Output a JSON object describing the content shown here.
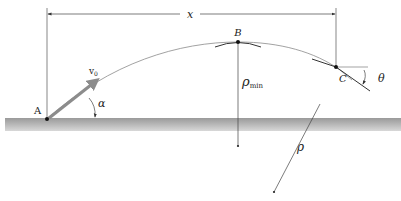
{
  "diagram": {
    "labels": {
      "distance": "x",
      "point_a": "A",
      "point_b": "B",
      "point_c": "C",
      "velocity": "v",
      "velocity_sub": "0",
      "launch_angle": "α",
      "rho_min": "ρ",
      "rho_min_sub": "min",
      "rho": "ρ",
      "theta": "θ"
    },
    "colors": {
      "line": "#555555",
      "trajectory": "#8a8a8a",
      "arrow": "#8c8c8c",
      "ground": "#b5b5b5",
      "point": "#111111"
    }
  }
}
